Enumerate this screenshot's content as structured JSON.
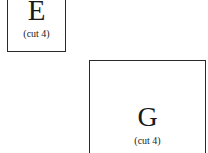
{
  "diagram": {
    "boxes": [
      {
        "id": "E",
        "label": "E",
        "note": "(cut 4)"
      },
      {
        "id": "G",
        "label": "G",
        "note": "(cut 4)"
      }
    ]
  }
}
